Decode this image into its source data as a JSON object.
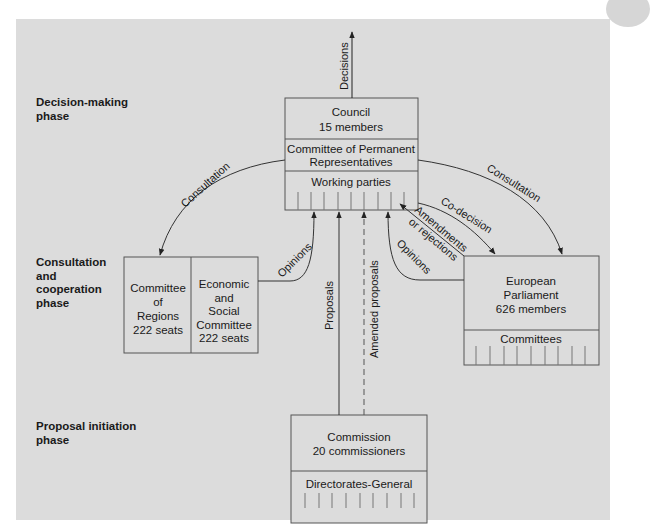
{
  "phases": {
    "decision": [
      "Decision-making",
      "phase"
    ],
    "consultation": [
      "Consultation",
      "and",
      "cooperation",
      "phase"
    ],
    "proposal": [
      "Proposal initiation",
      "phase"
    ]
  },
  "council": {
    "title": "Council",
    "members": "15 members",
    "coreper_line1": "Committee of Permanent",
    "coreper_line2": "Representatives",
    "working_parties": "Working parties"
  },
  "committee_regions": {
    "line1": "Committee",
    "line2": "of",
    "line3": "Regions",
    "seats": "222 seats"
  },
  "esc": {
    "line1": "Economic",
    "line2": "and",
    "line3": "Social",
    "line4": "Committee",
    "seats": "222 seats"
  },
  "parliament": {
    "line1": "European",
    "line2": "Parliament",
    "members": "626 members",
    "committees": "Committees"
  },
  "commission": {
    "title": "Commission",
    "members": "20 commissioners",
    "dg": "Directorates-General"
  },
  "arrows": {
    "decisions": "Decisions",
    "consultation_left": "Consultation",
    "consultation_right": "Consultation",
    "opinions_left": "Opinions",
    "opinions_right": "Opinions",
    "proposals": "Proposals",
    "amended_proposals": "Amended proposals",
    "co_decision": "Co-decision",
    "amendments_1": "Amendments",
    "amendments_2": "or rejections"
  },
  "colors": {
    "panel": "#dcdcdc",
    "line": "#444444",
    "text": "#1a1a1a"
  }
}
